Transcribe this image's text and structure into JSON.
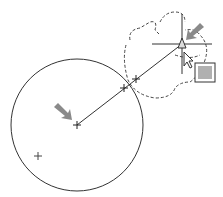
{
  "canvas": {
    "width": 223,
    "height": 197,
    "background": "#ffffff"
  },
  "colors": {
    "stroke": "#333333",
    "arrow": "#8a8a8a",
    "dashed": "#444444",
    "grip_fill": "#b0b0b0"
  },
  "circle": {
    "cx": 77,
    "cy": 125,
    "r": 66
  },
  "center_mark": {
    "x": 77,
    "y": 125
  },
  "extra_mark": {
    "x": 38,
    "y": 156
  },
  "line": {
    "x1": 77,
    "y1": 125,
    "x2": 182,
    "y2": 44
  },
  "intersection_marks": [
    {
      "x": 124,
      "y": 88
    },
    {
      "x": 136,
      "y": 79
    }
  ],
  "cursor": {
    "x": 182,
    "y": 44,
    "icon": "crosshair-cursor"
  },
  "grip_box": {
    "x": 195,
    "y": 63,
    "w": 20,
    "h": 19
  },
  "arrows": [
    {
      "name": "center-pointer-arrow",
      "from": [
        56,
        104
      ],
      "to": [
        70,
        118
      ]
    },
    {
      "name": "endpoint-pointer-arrow",
      "from": [
        202,
        25
      ],
      "to": [
        188,
        39
      ]
    }
  ]
}
